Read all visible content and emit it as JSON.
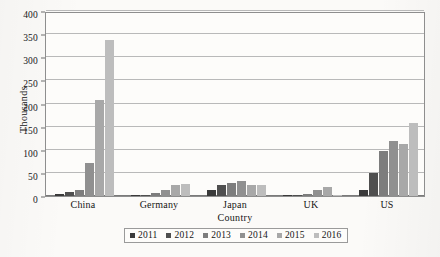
{
  "chart_data": {
    "type": "bar",
    "title": "",
    "subtitle": "",
    "xlabel": "Country",
    "ylabel": "Thousands",
    "ylim": [
      0,
      400
    ],
    "ytick_step": 50,
    "yticks": [
      0,
      50,
      100,
      150,
      200,
      250,
      300,
      350,
      400
    ],
    "ytick_labels": [
      "0",
      "50",
      "100",
      "150",
      "200",
      "250",
      "300",
      "350",
      "400"
    ],
    "grid": true,
    "grid_axis": "y",
    "legend_position": "bottom",
    "legend_border": true,
    "categories": [
      "China",
      "Germany",
      "Japan",
      "UK",
      "US"
    ],
    "series": [
      {
        "name": "2011",
        "color": "#3a3a3a",
        "values": [
          4,
          1,
          13,
          1,
          14
        ]
      },
      {
        "name": "2012",
        "color": "#4f4f4f",
        "values": [
          9,
          2,
          24,
          2,
          50
        ]
      },
      {
        "name": "2013",
        "color": "#7d7d7d",
        "values": [
          14,
          7,
          29,
          4,
          98
        ]
      },
      {
        "name": "2014",
        "color": "#909090",
        "values": [
          72,
          13,
          33,
          13,
          118
        ]
      },
      {
        "name": "2015",
        "color": "#a8a8a8",
        "values": [
          207,
          23,
          24,
          20,
          112
        ]
      },
      {
        "name": "2016",
        "color": "#bdbdbd",
        "values": [
          337,
          25,
          23,
          2,
          157
        ]
      }
    ],
    "axis_color": "#8e8e8e",
    "grid_color": "#b9b9b9",
    "plot_background": "#fdfcfa",
    "page_background": "#fbfaf8"
  }
}
